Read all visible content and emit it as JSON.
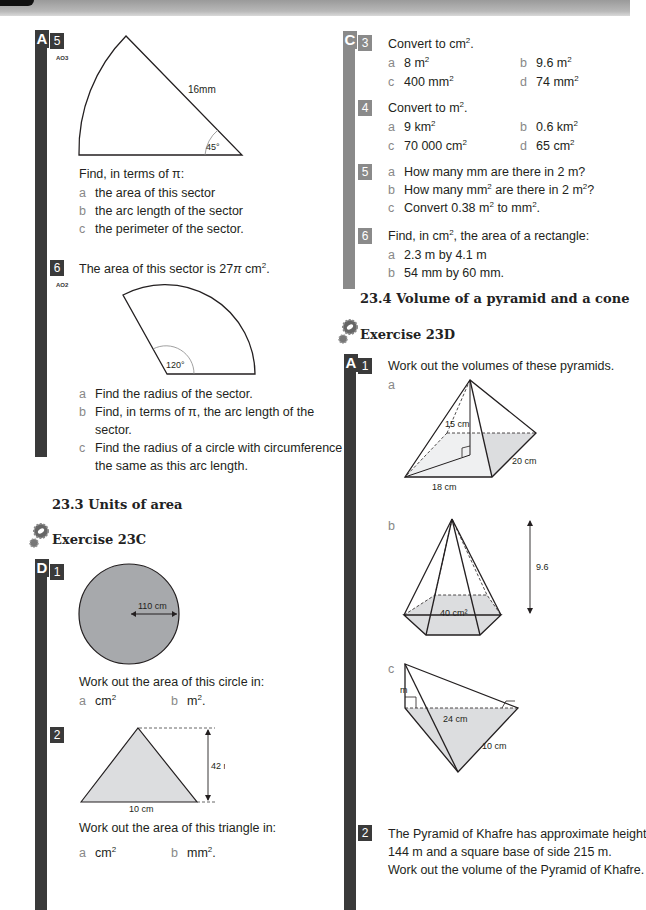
{
  "left_column": {
    "q5": {
      "level": "A",
      "number": "5",
      "ao": "AO3",
      "diagram": {
        "radius_label": "16mm",
        "angle_label": "45°"
      },
      "prompt": "Find, in terms of π:",
      "parts": [
        {
          "label": "a",
          "text": "the area of this sector"
        },
        {
          "label": "b",
          "text": "the arc length of the sector"
        },
        {
          "label": "c",
          "text": "the perimeter of the sector."
        }
      ]
    },
    "q6": {
      "number": "6",
      "ao": "AO2",
      "prompt": "The area of this sector is 27π cm².",
      "diagram": {
        "angle_label": "120°"
      },
      "parts": [
        {
          "label": "a",
          "text": "Find the radius of the sector."
        },
        {
          "label": "b",
          "text": "Find, in terms of π, the arc length of the",
          "text2": "sector."
        },
        {
          "label": "c",
          "text": "Find the radius of a circle with circumference",
          "text2": "the same as this arc length."
        }
      ]
    },
    "section_23_3": "23.3 Units of area",
    "exercise_23C": "Exercise 23C",
    "c_q1": {
      "level": "D",
      "number": "1",
      "diagram": {
        "radius_label": "110 cm",
        "fill": "#a7a9ac"
      },
      "prompt": "Work out the area of this circle in:",
      "parts": [
        {
          "label": "a",
          "text": "cm²"
        },
        {
          "label": "b",
          "text": "m²."
        }
      ]
    },
    "c_q2": {
      "number": "2",
      "diagram": {
        "height_label": "42 mm",
        "base_label": "10 cm",
        "fill": "#dcdddf"
      },
      "prompt": "Work out the area of this triangle in:",
      "parts": [
        {
          "label": "a",
          "text": "cm²"
        },
        {
          "label": "b",
          "text": "mm²."
        }
      ]
    }
  },
  "right_column": {
    "q3": {
      "level": "C",
      "number": "3",
      "prompt": "Convert to cm².",
      "parts": [
        {
          "label": "a",
          "text": "8 m²"
        },
        {
          "label": "b",
          "text": "9.6 m²"
        },
        {
          "label": "c",
          "text": "400 mm²"
        },
        {
          "label": "d",
          "text": "74 mm²"
        }
      ]
    },
    "q4": {
      "number": "4",
      "prompt": "Convert to m².",
      "parts": [
        {
          "label": "a",
          "text": "9 km²"
        },
        {
          "label": "b",
          "text": "0.6 km²"
        },
        {
          "label": "c",
          "text": "70 000 cm²"
        },
        {
          "label": "d",
          "text": "65 cm²"
        }
      ]
    },
    "q5": {
      "number": "5",
      "parts": [
        {
          "label": "a",
          "text": "How many mm are there in 2 m?"
        },
        {
          "label": "b",
          "text": "How many mm² are there in 2 m²?"
        },
        {
          "label": "c",
          "text": "Convert 0.38 m² to mm²."
        }
      ]
    },
    "q6": {
      "number": "6",
      "prompt": "Find, in cm², the area of a rectangle:",
      "parts": [
        {
          "label": "a",
          "text": "2.3 m by 4.1 m"
        },
        {
          "label": "b",
          "text": "54 mm by 60 mm."
        }
      ]
    },
    "section_23_4": "23.4 Volume of a pyramid and a cone",
    "exercise_23D": "Exercise 23D",
    "d_q1": {
      "level": "A",
      "number": "1",
      "prompt": "Work out the volumes of these pyramids.",
      "a": {
        "label": "a",
        "height": "15 cm",
        "depth": "20 cm",
        "width": "18 cm"
      },
      "b": {
        "label": "b",
        "height": "9.6 cm",
        "base_area": "40 cm²"
      },
      "c": {
        "label": "c",
        "height": "8 cm",
        "length": "24 cm",
        "side": "10 cm"
      }
    },
    "d_q2": {
      "number": "2",
      "lines": [
        "The Pyramid of Khafre has approximate height",
        "144 m and a square base of side 215 m.",
        "Work out the volume of the Pyramid of Khafre."
      ]
    }
  },
  "colors": {
    "level_dark": "#3a3a3a",
    "level_mid": "#8a8a8a",
    "shape_fill_light": "#dcdddf",
    "circle_fill": "#a7a9ac"
  }
}
